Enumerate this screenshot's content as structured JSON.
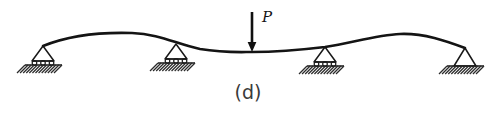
{
  "figure": {
    "caption": "(d)",
    "caption_x": 248,
    "caption_y": 99,
    "width": 497,
    "height": 113,
    "background_color": "#ffffff",
    "line_color": "#141414"
  },
  "beam": {
    "label": "deflected-beam",
    "stroke_color": "#141414",
    "stroke_width": 2.6,
    "path": "M 43 46 C 70 35, 100 32, 132 33 C 160 34, 176 44, 200 49 C 224 53, 240 52, 252 52 C 272 52, 300 50, 325 47 C 352 43, 376 35, 400 34 C 424 33, 446 41, 465 48",
    "start_x": 43,
    "start_y": 46,
    "end_x": 465,
    "end_y": 48,
    "left_crest_x": 132,
    "left_crest_y": 33,
    "right_crest_x": 400,
    "right_crest_y": 34
  },
  "load": {
    "name": "point-load-P",
    "label": "P",
    "label_x": 262,
    "label_y": 22,
    "arrow_x": 252,
    "arrow_top_y": 12,
    "arrow_tip_y": 52,
    "direction": "down",
    "color": "#101010"
  },
  "supports": [
    {
      "id": "support-1",
      "type": "roller",
      "apex_x": 43,
      "apex_y": 46,
      "tri_half_width": 11,
      "tri_base_y": 61,
      "roller_count": 3,
      "roller_y": 63,
      "roller_r": 2.3,
      "plate_x": 25,
      "plate_y": 65,
      "plate_w": 37,
      "hatch_count": 11,
      "hatch_depth": 8
    },
    {
      "id": "support-2",
      "type": "roller",
      "apex_x": 176,
      "apex_y": 44,
      "tri_half_width": 11,
      "tri_base_y": 59,
      "roller_count": 3,
      "roller_y": 61,
      "roller_r": 2.3,
      "plate_x": 158,
      "plate_y": 63,
      "plate_w": 37,
      "hatch_count": 11,
      "hatch_depth": 8
    },
    {
      "id": "support-3",
      "type": "roller",
      "apex_x": 325,
      "apex_y": 47,
      "tri_half_width": 11,
      "tri_base_y": 62,
      "roller_count": 3,
      "roller_y": 64,
      "roller_r": 2.3,
      "plate_x": 307,
      "plate_y": 66,
      "plate_w": 37,
      "hatch_count": 11,
      "hatch_depth": 8
    },
    {
      "id": "support-4",
      "type": "pin",
      "apex_x": 465,
      "apex_y": 48,
      "tri_half_width": 11,
      "tri_base_y": 66,
      "roller_count": 0,
      "roller_y": 0,
      "roller_r": 0,
      "plate_x": 447,
      "plate_y": 66,
      "plate_w": 37,
      "hatch_count": 11,
      "hatch_depth": 8
    }
  ]
}
